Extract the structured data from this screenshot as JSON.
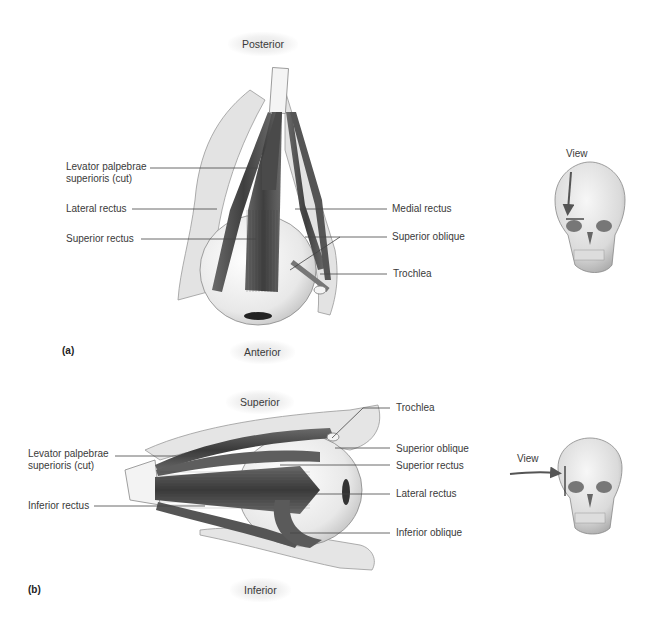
{
  "panel_a": {
    "tag": "(a)",
    "orientation_top": "Posterior",
    "orientation_bottom": "Anterior",
    "labels_left": [
      "Levator palpebrae superioris (cut)",
      "Lateral rectus",
      "Superior rectus"
    ],
    "labels_right": [
      "Medial rectus",
      "Superior oblique",
      "Trochlea"
    ],
    "inset": {
      "view_label": "View",
      "arrow_direction": "down"
    }
  },
  "panel_b": {
    "tag": "(b)",
    "orientation_top": "Superior",
    "orientation_bottom": "Inferior",
    "labels_left": [
      "Levator palpebrae superioris (cut)",
      "Inferior rectus"
    ],
    "labels_right": [
      "Trochlea",
      "Superior oblique",
      "Superior rectus",
      "Lateral rectus",
      "Inferior oblique"
    ],
    "inset": {
      "view_label": "View",
      "arrow_direction": "right"
    }
  },
  "colors": {
    "muscle": "#5a5a5a",
    "muscle_dark": "#3c3c3c",
    "bone": "#e4e4e4",
    "eyeball": "#f2f2f2",
    "leader_line": "#444444",
    "inset_arrow": "#555555"
  }
}
